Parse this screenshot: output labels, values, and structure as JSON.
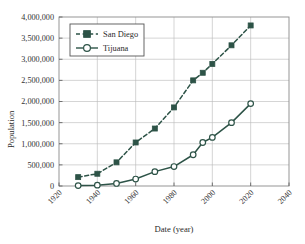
{
  "chart_data": {
    "type": "line",
    "title": "",
    "xlabel": "Date (year)",
    "ylabel": "Population",
    "xlim": [
      1920,
      2040
    ],
    "ylim": [
      0,
      4000000
    ],
    "grid": true,
    "legend_position": "top-left",
    "x_ticks": [
      "1920",
      "1940",
      "1960",
      "1980",
      "2000",
      "2020",
      "2040"
    ],
    "x_tick_values": [
      1920,
      1940,
      1960,
      1980,
      2000,
      2020,
      2040
    ],
    "y_ticks": [
      "0",
      "500,000",
      "1,000,000",
      "1,500,000",
      "2,000,000",
      "2,500,000",
      "3,000,000",
      "3,500,000",
      "4,000,000"
    ],
    "y_tick_values": [
      0,
      500000,
      1000000,
      1500000,
      2000000,
      2500000,
      3000000,
      3500000,
      4000000
    ],
    "series": [
      {
        "name": "San Diego",
        "marker": "filled-square",
        "line_style": "dashed",
        "color": "#2d5347",
        "points": [
          [
            1930,
            210000
          ],
          [
            1940,
            290000
          ],
          [
            1950,
            560000
          ],
          [
            1960,
            1030000
          ],
          [
            1970,
            1360000
          ],
          [
            1980,
            1860000
          ],
          [
            1990,
            2500000
          ],
          [
            1995,
            2680000
          ],
          [
            2000,
            2890000
          ],
          [
            2010,
            3330000
          ],
          [
            2020,
            3800000
          ]
        ]
      },
      {
        "name": "Tijuana",
        "marker": "open-circle",
        "line_style": "solid",
        "color": "#2d5347",
        "points": [
          [
            1930,
            10000
          ],
          [
            1940,
            20000
          ],
          [
            1950,
            60000
          ],
          [
            1960,
            165000
          ],
          [
            1970,
            340000
          ],
          [
            1980,
            460000
          ],
          [
            1990,
            740000
          ],
          [
            1995,
            1030000
          ],
          [
            2000,
            1150000
          ],
          [
            2010,
            1500000
          ],
          [
            2020,
            1950000
          ]
        ]
      }
    ]
  },
  "legend": {
    "entries": [
      {
        "label": "San Diego"
      },
      {
        "label": "Tijuana"
      }
    ]
  },
  "colors": {
    "series": "#2d5347",
    "grid": "#b9b9b9",
    "frame": "#8a8a8a",
    "text": "#2b2b2b",
    "background": "#ffffff"
  }
}
